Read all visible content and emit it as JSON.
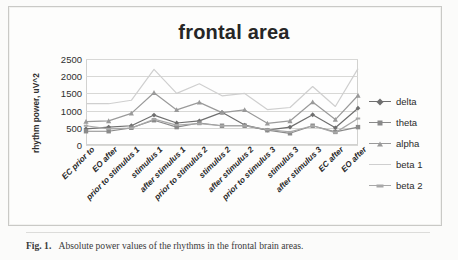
{
  "figure": {
    "caption_label": "Fig. 1.",
    "caption_text": "Absolute power values of the rhythms in the frontal brain areas."
  },
  "chart_data": {
    "type": "line",
    "title": "frontal area",
    "xlabel": "",
    "ylabel": "rhythm power, uV^2",
    "ylim": [
      0,
      2500
    ],
    "yticks": [
      0,
      500,
      1000,
      1500,
      2000,
      2500
    ],
    "grid": true,
    "legend_position": "right",
    "categories": [
      "EC prior to",
      "EO after",
      "prior to stimulus 1",
      "stimulus 1",
      "after stimulus 1",
      "prior to stimulus 2",
      "stimulus 2",
      "after stimulus 2",
      "prior to stimulus 3",
      "stimulus 3",
      "after stimulus 3",
      "EC after",
      "EO after"
    ],
    "series": [
      {
        "name": "delta",
        "marker": "diamond",
        "color": "#6f6f6f",
        "values": [
          470,
          520,
          560,
          870,
          640,
          700,
          950,
          580,
          430,
          520,
          880,
          500,
          1070
        ]
      },
      {
        "name": "theta",
        "marker": "square",
        "color": "#8a8a8a",
        "values": [
          400,
          400,
          500,
          720,
          520,
          640,
          560,
          560,
          430,
          340,
          560,
          380,
          520
        ]
      },
      {
        "name": "alpha",
        "marker": "triangle",
        "color": "#9a9a9a",
        "values": [
          680,
          700,
          920,
          1520,
          1020,
          1240,
          940,
          1020,
          630,
          700,
          1250,
          740,
          1440
        ]
      },
      {
        "name": "beta 1",
        "marker": "none",
        "color": "#cfcfcf",
        "values": [
          1200,
          1200,
          1300,
          2200,
          1500,
          1780,
          1430,
          1500,
          1030,
          1090,
          1700,
          1120,
          2220
        ]
      },
      {
        "name": "beta 2",
        "marker": "dash",
        "color": "#a8a8a8",
        "values": [
          560,
          470,
          490,
          750,
          580,
          620,
          560,
          560,
          450,
          380,
          560,
          360,
          770
        ]
      }
    ]
  }
}
